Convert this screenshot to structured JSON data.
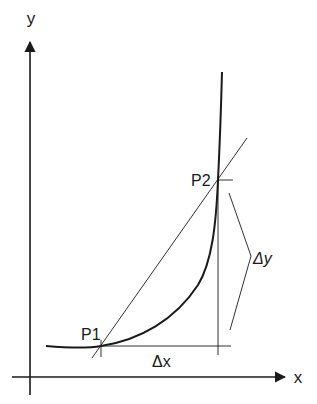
{
  "diagram": {
    "axes": {
      "x_label": "x",
      "y_label": "y"
    },
    "points": [
      {
        "label": "P1",
        "x": 101,
        "y": 346
      },
      {
        "label": "P2",
        "x": 218,
        "y": 180
      }
    ],
    "annotations": {
      "delta_x": "Δx",
      "delta_y": "Δy"
    },
    "colors": {
      "stroke": "#1a1a1a",
      "background": "#ffffff"
    }
  }
}
